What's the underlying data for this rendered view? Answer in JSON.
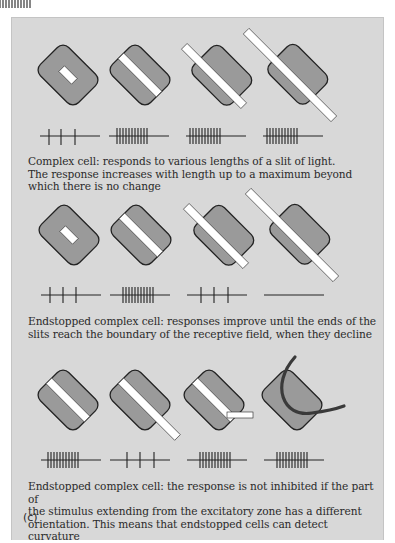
{
  "figure": {
    "panel_label": "(c)",
    "colors": {
      "background": "#d8d8d8",
      "receptive_field": "#9a9a9a",
      "outline": "#222222",
      "slit": "#ffffff",
      "curve": "#3a3a3a"
    },
    "rows": [
      {
        "caption": "Complex cell: responds to various lengths of a slit of light.\nThe response increases with length up to a maximum beyond\nwhich there is no change",
        "stimuli": [
          {
            "slit": "short, inside field",
            "spikes": 3
          },
          {
            "slit": "spans field",
            "spikes": 11
          },
          {
            "slit": "extends beyond field",
            "spikes": 11
          },
          {
            "slit": "long, extends well beyond field",
            "spikes": 11
          }
        ]
      },
      {
        "caption": "Endstopped complex cell: responses improve until the ends of the\nslits reach the boundary of the receptive field, when they decline",
        "stimuli": [
          {
            "slit": "short, inside field",
            "spikes": 3
          },
          {
            "slit": "spans field",
            "spikes": 11
          },
          {
            "slit": "extends beyond field",
            "spikes": 3
          },
          {
            "slit": "long, extends well beyond field",
            "spikes": 0
          }
        ]
      },
      {
        "caption": "Endstopped complex cell: the response is not inhibited if the part of\nthe stimulus extending from the excitatory zone has a different\norientation.  This means that endstopped cells can detect curvature",
        "stimuli": [
          {
            "slit": "spans field",
            "spikes": 11
          },
          {
            "slit": "extends beyond field, same orientation",
            "spikes": 3
          },
          {
            "slit": "extension with different orientation",
            "spikes": 11
          },
          {
            "slit": "curved stimulus",
            "spikes": 11
          }
        ]
      }
    ]
  }
}
